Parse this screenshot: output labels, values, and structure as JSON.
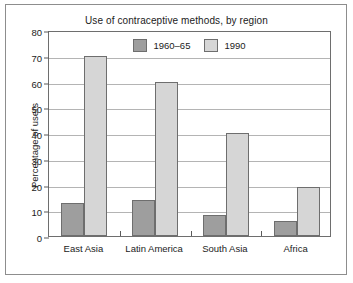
{
  "chart_data": {
    "type": "bar",
    "title": "Use of contraceptive methods, by region",
    "xlabel": "",
    "ylabel": "Percentage of users",
    "categories": [
      "East Asia",
      "Latin America",
      "South Asia",
      "Africa"
    ],
    "series": [
      {
        "name": "1960–65",
        "color": "#9e9e9e",
        "values": [
          13,
          14,
          8,
          6
        ]
      },
      {
        "name": "1990",
        "color": "#d6d6d6",
        "values": [
          70,
          60,
          40,
          19
        ]
      }
    ],
    "ylim": [
      0,
      80
    ],
    "yticks": [
      0,
      10,
      20,
      30,
      40,
      50,
      60,
      70,
      80
    ],
    "ytick_labels": [
      "0",
      "10",
      "20",
      "30",
      "40",
      "50",
      "60",
      "70",
      "80"
    ],
    "grid": true,
    "legend_position": "top-center-inside"
  },
  "colors": {
    "series_1960": "#9e9e9e",
    "series_1990": "#d6d6d6",
    "bar_outline": "#6e6e6e",
    "gridline": "#b4b4b4",
    "axis": "#6e6e6e",
    "frame": "#8d8d8d",
    "text": "#1b1b1b",
    "background": "#ffffff"
  }
}
